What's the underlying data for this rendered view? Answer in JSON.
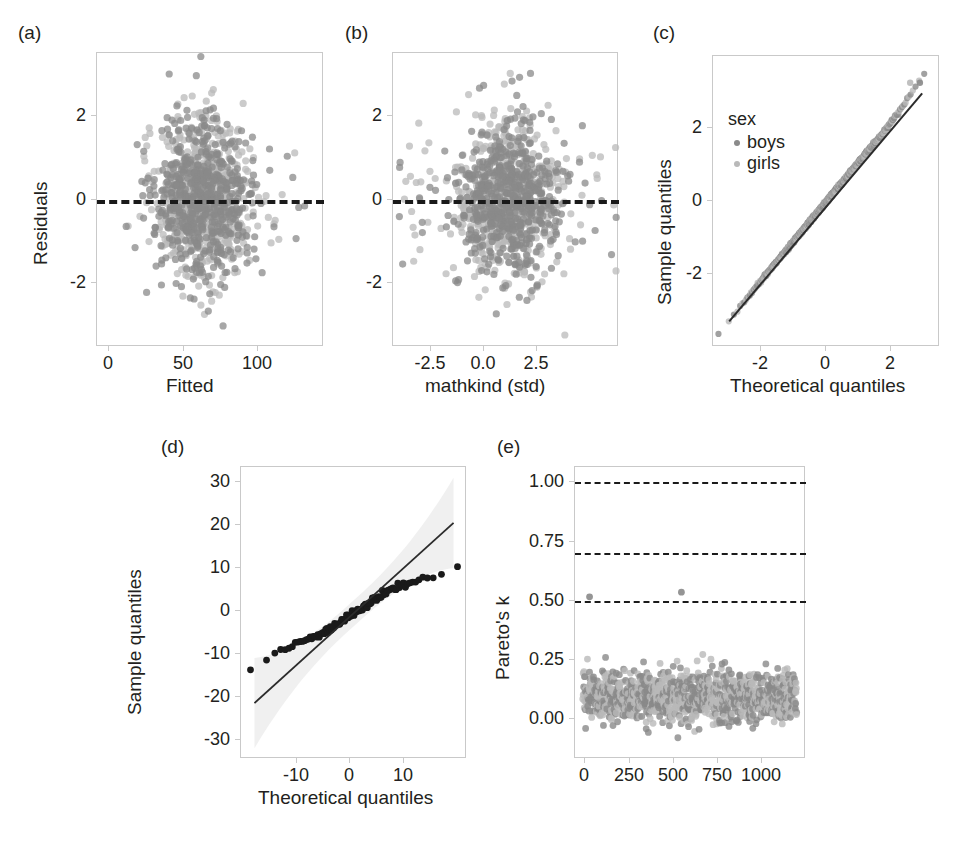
{
  "figure": {
    "panels": [
      {
        "key": "a",
        "label": "(a)",
        "xlabel": "Fitted",
        "ylabel": "Residuals"
      },
      {
        "key": "b",
        "label": "(b)",
        "xlabel": "mathkind (std)",
        "ylabel": ""
      },
      {
        "key": "c",
        "label": "(c)",
        "xlabel": "Theoretical quantiles",
        "ylabel": "Sample quantiles"
      },
      {
        "key": "d",
        "label": "(d)",
        "xlabel": "Theoretical quantiles",
        "ylabel": "Sample quantiles"
      },
      {
        "key": "e",
        "label": "(e)",
        "xlabel": "",
        "ylabel": "Pareto's k"
      }
    ],
    "legend": {
      "title": "sex",
      "items": [
        {
          "label": "boys",
          "color": "#8a8a8a"
        },
        {
          "label": "girls",
          "color": "#b9b9b9"
        }
      ]
    },
    "colors": {
      "boys": "#8a8a8a",
      "girls": "#b9b9b9",
      "dark_point": "#1a1a1a",
      "reference_line": "#2b2b2b",
      "dashed_line": "#1a1a1a",
      "axis": "#c9c9c9",
      "band": "#ededed"
    },
    "caption_partial": ""
  },
  "chart_data": [
    {
      "panel": "a",
      "type": "scatter",
      "title": "",
      "xlabel": "Fitted",
      "ylabel": "Residuals",
      "xlim": [
        -8,
        145
      ],
      "ylim": [
        -3.6,
        3.4
      ],
      "grid": false,
      "xticks": [
        0,
        50,
        100
      ],
      "xticklabels": [
        "0",
        "50",
        "100"
      ],
      "yticks": [
        -2,
        0,
        2
      ],
      "yticklabels": [
        "-2",
        "0",
        "2"
      ],
      "annotations": [
        {
          "type": "hline",
          "y": 0,
          "style": "dashed",
          "color": "#1a1a1a"
        }
      ],
      "series": [
        {
          "name": "boys",
          "color": "#8a8a8a",
          "n": 580,
          "x_center": 62,
          "x_spread": 16,
          "y_center": -0.05,
          "y_spread": 0.95
        },
        {
          "name": "girls",
          "color": "#b9b9b9",
          "n": 580,
          "x_center": 62,
          "x_spread": 16,
          "y_center": -0.05,
          "y_spread": 0.95
        }
      ]
    },
    {
      "panel": "b",
      "type": "scatter",
      "title": "",
      "xlabel": "mathkind (std)",
      "ylabel": "Residuals",
      "xlim": [
        -4.2,
        4.2
      ],
      "ylim": [
        -3.6,
        3.4
      ],
      "grid": false,
      "xticks": [
        -2.5,
        0.0,
        2.5
      ],
      "xticklabels": [
        "-2.5",
        "0.0",
        "2.5"
      ],
      "yticks": [
        -2,
        0,
        2
      ],
      "yticklabels": [
        "-2",
        "0",
        "2"
      ],
      "annotations": [
        {
          "type": "hline",
          "y": 0,
          "style": "dashed",
          "color": "#1a1a1a"
        }
      ],
      "series": [
        {
          "name": "boys",
          "color": "#8a8a8a",
          "n": 580,
          "x_center": 0.1,
          "x_spread": 1.0,
          "y_center": -0.05,
          "y_spread": 0.95
        },
        {
          "name": "girls",
          "color": "#b9b9b9",
          "n": 580,
          "x_center": 0.1,
          "x_spread": 1.0,
          "y_center": -0.05,
          "y_spread": 0.95
        }
      ]
    },
    {
      "panel": "c",
      "type": "scatter",
      "title": "",
      "xlabel": "Theoretical quantiles",
      "ylabel": "Sample quantiles",
      "xlim": [
        -3.5,
        3.5
      ],
      "ylim": [
        -3.7,
        3.7
      ],
      "grid": false,
      "xticks": [
        -2,
        0,
        2
      ],
      "xticklabels": [
        "-2",
        "0",
        "2"
      ],
      "yticks": [
        -2,
        0,
        2
      ],
      "yticklabels": [
        "-2",
        "0",
        "2"
      ],
      "annotations": [
        {
          "type": "line",
          "from": [
            -3.0,
            -3.05
          ],
          "to": [
            2.95,
            2.75
          ],
          "color": "#2b2b2b"
        }
      ],
      "legend": {
        "title": "sex",
        "entries": [
          "boys",
          "girls"
        ],
        "position": "upper left"
      },
      "series": [
        {
          "name": "boys",
          "color": "#8a8a8a",
          "description": "qq points along identity line, slight upper-tail excess"
        },
        {
          "name": "girls",
          "color": "#b9b9b9",
          "description": "qq points along identity line, slight upper-tail excess"
        }
      ]
    },
    {
      "panel": "d",
      "type": "scatter",
      "title": "",
      "xlabel": "Theoretical quantiles",
      "ylabel": "Sample quantiles",
      "xlim": [
        -21,
        21
      ],
      "ylim": [
        -34,
        34
      ],
      "grid": false,
      "xticks": [
        -10,
        0,
        10
      ],
      "xticklabels": [
        "-10",
        "0",
        "10"
      ],
      "yticks": [
        -30,
        -20,
        -10,
        0,
        10,
        20,
        30
      ],
      "yticklabels": [
        "-30",
        "-20",
        "-10",
        "0",
        "10",
        "20",
        "30"
      ],
      "annotations": [
        {
          "type": "line",
          "from": [
            -18.5,
            -21.0
          ],
          "to": [
            18.5,
            21.0
          ],
          "color": "#2b2b2b"
        },
        {
          "type": "band",
          "label": "confidence envelope",
          "color": "#ededed"
        }
      ],
      "series": [
        {
          "name": "group effects",
          "color": "#1a1a1a",
          "description": "S-shaped qq curve, shallower slope than reference line; extreme points (-18,-15.4) and (18,19.5)"
        }
      ]
    },
    {
      "panel": "e",
      "type": "scatter",
      "title": "",
      "xlabel": "",
      "ylabel": "Pareto's k",
      "xlim": [
        -40,
        1230
      ],
      "ylim": [
        -0.18,
        1.08
      ],
      "grid": false,
      "xticks": [
        0,
        250,
        500,
        750,
        1000
      ],
      "xticklabels": [
        "0",
        "250",
        "500",
        "750",
        "1000"
      ],
      "yticks": [
        0.0,
        0.25,
        0.5,
        0.75,
        1.0
      ],
      "yticklabels": [
        "0.00",
        "0.25",
        "0.50",
        "0.75",
        "1.00"
      ],
      "annotations": [
        {
          "type": "hline",
          "y": 1.0,
          "style": "dashed",
          "color": "#1a1a1a"
        },
        {
          "type": "hline",
          "y": 0.7,
          "style": "dashed",
          "color": "#1a1a1a"
        },
        {
          "type": "hline",
          "y": 0.5,
          "style": "dashed",
          "color": "#1a1a1a"
        }
      ],
      "series": [
        {
          "name": "boys",
          "color": "#8a8a8a",
          "n": 580,
          "y_center": 0.09,
          "y_spread": 0.07,
          "outliers": [
            {
              "x": 40,
              "y": 0.52
            },
            {
              "x": 545,
              "y": 0.54
            }
          ]
        },
        {
          "name": "girls",
          "color": "#b9b9b9",
          "n": 580,
          "y_center": 0.09,
          "y_spread": 0.07,
          "outliers": []
        }
      ]
    }
  ]
}
